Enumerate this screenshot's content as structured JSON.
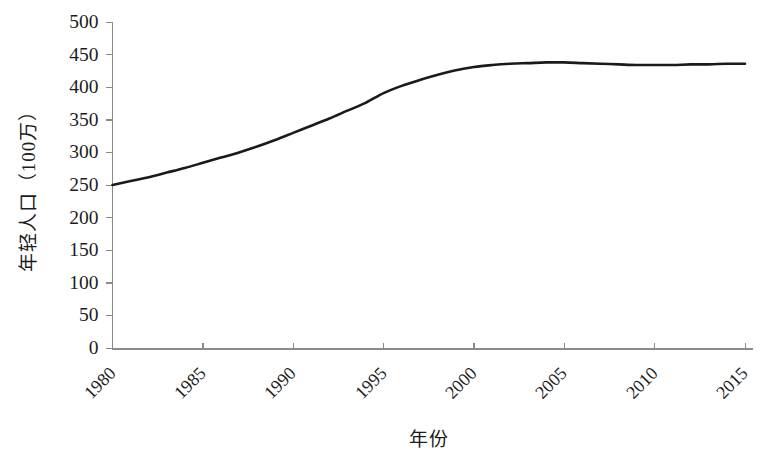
{
  "chart_data": {
    "type": "line",
    "title": "",
    "subtitle": "",
    "xlabel": "年份",
    "ylabel": "年轻人口（100万）",
    "x_tick_labels": [
      "1980",
      "1985",
      "1990",
      "1995",
      "2000",
      "2005",
      "2010",
      "2015"
    ],
    "y_tick_labels": [
      "0",
      "50",
      "100",
      "150",
      "200",
      "250",
      "300",
      "350",
      "400",
      "450",
      "500"
    ],
    "xlim": [
      1980,
      2015
    ],
    "ylim": [
      0,
      500
    ],
    "y_tick_step": 50,
    "x_tick_step": 5,
    "grid": false,
    "legend": null,
    "legend_position": "none",
    "annotations": [],
    "series": [
      {
        "name": "年轻人口",
        "color": "#1a1a1a",
        "line_width": 2.6,
        "markers": false,
        "x": [
          1980,
          1981,
          1982,
          1983,
          1984,
          1985,
          1986,
          1987,
          1988,
          1989,
          1990,
          1991,
          1992,
          1993,
          1994,
          1995,
          1996,
          1997,
          1998,
          1999,
          2000,
          2001,
          2002,
          2003,
          2004,
          2005,
          2006,
          2007,
          2008,
          2009,
          2010,
          2011,
          2012,
          2013,
          2014,
          2015
        ],
        "values": [
          250,
          256,
          262,
          269,
          276,
          284,
          292,
          300,
          309,
          319,
          330,
          341,
          352,
          364,
          376,
          391,
          402,
          411,
          419,
          426,
          431,
          434,
          436,
          437,
          438,
          438,
          437,
          436,
          435,
          434,
          434,
          434,
          435,
          435,
          436,
          436
        ]
      }
    ]
  },
  "axes": {
    "y_axis_color": "#8a8a8a",
    "x_axis_color": "#8a8a8a"
  }
}
